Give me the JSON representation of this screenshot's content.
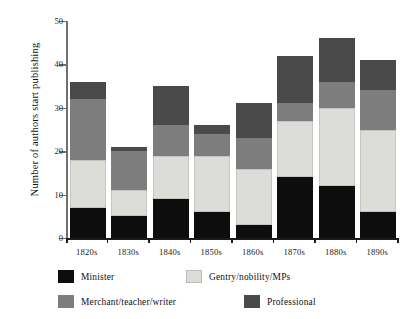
{
  "chart_data": {
    "type": "bar",
    "subtype": "stacked-bar",
    "title": "",
    "xlabel": "",
    "ylabel": "Number of authors start publishing",
    "categories": [
      "1820s",
      "1830s",
      "1840s",
      "1850s",
      "1860s",
      "1870s",
      "1880s",
      "1890s"
    ],
    "ylim": [
      0,
      50
    ],
    "yticks": [
      0,
      10,
      20,
      30,
      40,
      50
    ],
    "ytick_labels": [
      "0",
      "10",
      "20",
      "30",
      "40",
      "50"
    ],
    "grid": false,
    "legend_position": "below-axes",
    "series": [
      {
        "name": "Minister",
        "color": "#0d0d0d",
        "values": [
          7,
          5,
          9,
          6,
          3,
          14,
          12,
          6
        ]
      },
      {
        "name": "Gentry/nobility/MPs",
        "color": "#dcdcd8",
        "values": [
          11,
          6,
          10,
          13,
          13,
          13,
          18,
          19
        ]
      },
      {
        "name": "Merchant/teacher/writer",
        "color": "#7d7d7d",
        "values": [
          14,
          9,
          7,
          5,
          7,
          4,
          6,
          9
        ]
      },
      {
        "name": "Professional",
        "color": "#4a4a4a",
        "values": [
          4,
          1,
          9,
          2,
          8,
          11,
          10,
          7
        ]
      }
    ],
    "cumulative_tops": {
      "1820s": [
        7,
        18,
        32,
        36
      ],
      "1830s": [
        5,
        11,
        20,
        21
      ],
      "1840s": [
        9,
        19,
        26,
        35
      ],
      "1850s": [
        6,
        19,
        24,
        26
      ],
      "1860s": [
        3,
        16,
        23,
        31
      ],
      "1870s": [
        14,
        27,
        31,
        42
      ],
      "1880s": [
        12,
        30,
        36,
        46
      ],
      "1890s": [
        6,
        25,
        34,
        41
      ]
    },
    "totals": [
      36,
      21,
      35,
      26,
      31,
      42,
      46,
      41
    ]
  },
  "legend": {
    "items": [
      {
        "label": "Minister",
        "color": "#0d0d0d"
      },
      {
        "label": "Gentry/nobility/MPs",
        "color": "#dcdcd8"
      },
      {
        "label": "Merchant/teacher/writer",
        "color": "#7d7d7d"
      },
      {
        "label": "Professional",
        "color": "#4a4a4a"
      }
    ]
  }
}
